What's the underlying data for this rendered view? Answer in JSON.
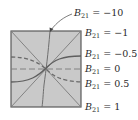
{
  "diagram": {
    "box": {
      "fill": "#c9c9c9",
      "border": "#5a5a5a"
    },
    "curve_color": "#6e6e6e",
    "labels": [
      {
        "var": "B",
        "sub": "21",
        "text": " = −10"
      },
      {
        "var": "B",
        "sub": "21",
        "text": " = −1"
      },
      {
        "var": "B",
        "sub": "21",
        "text": " = −0.5"
      },
      {
        "var": "B",
        "sub": "21",
        "text": " = 0"
      },
      {
        "var": "B",
        "sub": "21",
        "text": " = 0.5"
      },
      {
        "var": "B",
        "sub": "21",
        "text": " = 1"
      }
    ]
  }
}
